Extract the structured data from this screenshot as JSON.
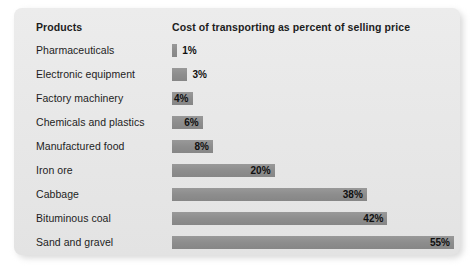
{
  "card": {
    "background_color": "#e9e9e9",
    "bar_color": "#8f8f8f",
    "text_color": "#1d1d1d"
  },
  "header": {
    "products_label": "Products",
    "measure_label": "Cost of transporting as percent of selling price"
  },
  "chart_data": {
    "type": "bar",
    "orientation": "horizontal",
    "title": "Cost of transporting as percent of selling price",
    "xlabel": "Cost of transporting as percent of selling price",
    "ylabel": "Products",
    "xlim": [
      0,
      55
    ],
    "grid": false,
    "legend": null,
    "value_suffix": "%",
    "categories": [
      "Pharmaceuticals",
      "Electronic equipment",
      "Factory machinery",
      "Chemicals and plastics",
      "Manufactured food",
      "Iron ore",
      "Cabbage",
      "Bituminous coal",
      "Sand and gravel"
    ],
    "values": [
      1,
      3,
      4,
      6,
      8,
      20,
      38,
      42,
      55
    ],
    "value_labels": [
      "1%",
      "3%",
      "4%",
      "6%",
      "8%",
      "20%",
      "38%",
      "42%",
      "55%"
    ],
    "bars": [
      {
        "category": "Pharmaceuticals",
        "value": 1,
        "label": "1%",
        "label_position": "outside"
      },
      {
        "category": "Electronic equipment",
        "value": 3,
        "label": "3%",
        "label_position": "outside"
      },
      {
        "category": "Factory machinery",
        "value": 4,
        "label": "4%",
        "label_position": "inside"
      },
      {
        "category": "Chemicals and plastics",
        "value": 6,
        "label": "6%",
        "label_position": "inside"
      },
      {
        "category": "Manufactured food",
        "value": 8,
        "label": "8%",
        "label_position": "inside"
      },
      {
        "category": "Iron ore",
        "value": 20,
        "label": "20%",
        "label_position": "inside"
      },
      {
        "category": "Cabbage",
        "value": 38,
        "label": "38%",
        "label_position": "inside"
      },
      {
        "category": "Bituminous coal",
        "value": 42,
        "label": "42%",
        "label_position": "inside"
      },
      {
        "category": "Sand and gravel",
        "value": 55,
        "label": "55%",
        "label_position": "inside"
      }
    ]
  }
}
